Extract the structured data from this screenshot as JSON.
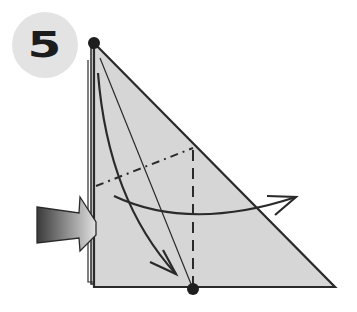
{
  "diagram": {
    "type": "origami-instruction",
    "step_number": "5",
    "colors": {
      "paper": "#d6d6d6",
      "outline": "#2a2a2a",
      "badge_bg": "#e3e3e3",
      "arrow_dark": "#3a3a3a",
      "arrow_light": "#e0e0e0"
    },
    "elements": {
      "paper_shape": "triangle",
      "valley_fold_line": "dashed vertical",
      "mountain_fold_line": "dash-dot diagonal",
      "fold_arrow": "curved arrow to the right",
      "point_arrow": "curved arrow from top point down to bottom",
      "push_arrow": "inside-reverse push arrow from left",
      "reference_points": [
        "top-corner",
        "bottom-point"
      ]
    }
  }
}
